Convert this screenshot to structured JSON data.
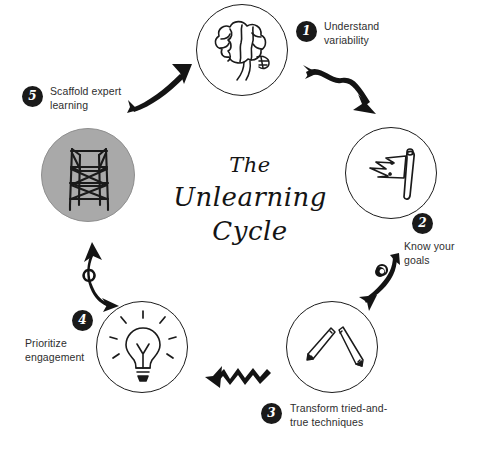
{
  "diagram": {
    "title_lines": [
      "The",
      "Unlearning",
      "Cycle"
    ],
    "background_color": "#ffffff",
    "ink_color": "#1c1c1c",
    "badge_color": "#1a1a1a",
    "highlight_fill": "#a9a9a9"
  },
  "steps": [
    {
      "number": "1",
      "label_line1": "Understand",
      "label_line2": "variability",
      "icon": "brain-icon",
      "highlighted": false
    },
    {
      "number": "2",
      "label_line1": "Know your",
      "label_line2": "goals",
      "icon": "flag-icon",
      "highlighted": false
    },
    {
      "number": "3",
      "label_line1": "Transform tried-and-",
      "label_line2": "true techniques",
      "icon": "pencils-icon",
      "highlighted": false
    },
    {
      "number": "4",
      "label_line1": "Prioritize",
      "label_line2": "engagement",
      "icon": "lightbulb-icon",
      "highlighted": false
    },
    {
      "number": "5",
      "label_line1": "Scaffold expert",
      "label_line2": "learning",
      "icon": "scaffolding-icon",
      "highlighted": true
    }
  ],
  "connectors": [
    {
      "from": "1",
      "to": "2",
      "style": "curved-arrow"
    },
    {
      "from": "2",
      "to": "3",
      "style": "hooked-arrow"
    },
    {
      "from": "3",
      "to": "4",
      "style": "zigzag-arrow"
    },
    {
      "from": "4",
      "to": "5",
      "style": "hooked-arrow"
    },
    {
      "from": "5",
      "to": "1",
      "style": "straight-arrow"
    }
  ]
}
